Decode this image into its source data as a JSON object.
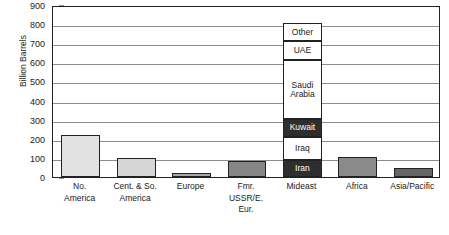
{
  "chart_data": {
    "type": "bar",
    "title": "",
    "xlabel": "",
    "ylabel": "Billion Barrels",
    "ylim": [
      0,
      900
    ],
    "ytick_step": 100,
    "yticks": [
      "900",
      "800",
      "700",
      "600",
      "500",
      "400",
      "300",
      "200",
      "100",
      "0"
    ],
    "grid": true,
    "legend": "none",
    "categories": [
      "No. America",
      "Cent. & So. America",
      "Europe",
      "Fmr. USSR/E. Eur.",
      "Mideast",
      "Africa",
      "Asia/Pacific"
    ],
    "category_lines": [
      [
        "No.",
        "America"
      ],
      [
        "Cent. & So.",
        "America"
      ],
      [
        "Europe"
      ],
      [
        "Fmr.",
        "USSR/E.",
        "Eur."
      ],
      [
        "Mideast"
      ],
      [
        "Africa"
      ],
      [
        "Asia/Pacific"
      ]
    ],
    "values": [
      222,
      99,
      20,
      84,
      805,
      104,
      45
    ],
    "bar_colors": [
      "#e2e2e2",
      "#d6d6d6",
      "#a8a8a8",
      "#868686",
      "#2e2e2e",
      "#8a8a8a",
      "#666666"
    ],
    "stacked_category": "Mideast",
    "stack_segments": [
      {
        "label": "Iran",
        "value": 90,
        "start": 0,
        "end": 90,
        "fill": "dark"
      },
      {
        "label": "Iraq",
        "value": 122,
        "start": 90,
        "end": 212,
        "fill": "light"
      },
      {
        "label": "Kuwait",
        "value": 92,
        "start": 212,
        "end": 304,
        "fill": "dark"
      },
      {
        "label": "Saudi Arabia",
        "value": 307,
        "start": 304,
        "end": 611,
        "fill": "light"
      },
      {
        "label": "UAE",
        "value": 99,
        "start": 611,
        "end": 710,
        "fill": "light"
      },
      {
        "label": "Other",
        "value": 95,
        "start": 710,
        "end": 805,
        "fill": "light"
      }
    ],
    "stack_segment_lines": [
      [
        "Iran"
      ],
      [
        "Iraq"
      ],
      [
        "Kuwait"
      ],
      [
        "Saudi",
        "Arabia"
      ],
      [
        "UAE"
      ],
      [
        "Other"
      ]
    ]
  },
  "colors": {
    "axis": "#222222",
    "gridline": "#8d8d8d",
    "text": "#1a1a1a",
    "segment_dark": "#2e2e2e",
    "segment_light": "#ffffff"
  }
}
